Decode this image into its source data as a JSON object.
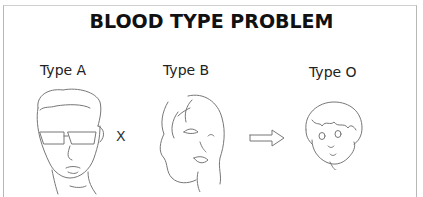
{
  "title": "BLOOD TYPE PROBLEM",
  "parents": [
    {
      "label": "Type A",
      "icon": "man-with-sunglasses-face"
    },
    {
      "label": "Type B",
      "icon": "woman-face"
    }
  ],
  "operator": "X",
  "result_arrow": "right-arrow-icon",
  "child": {
    "label": "Type O",
    "icon": "child-face"
  },
  "colors": {
    "line": "#777777",
    "frame": "#b8b8b8",
    "title": "#111111"
  }
}
